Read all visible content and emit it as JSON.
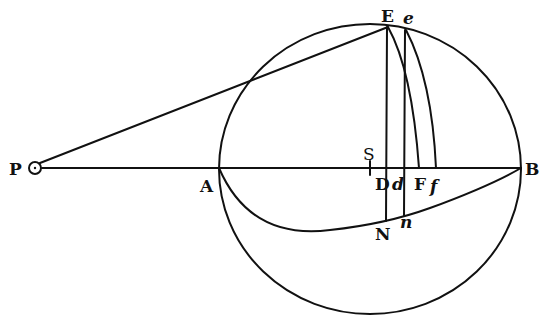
{
  "figure": {
    "type": "geometric-diagram",
    "colors": {
      "ink": "#111111",
      "background": "#ffffff"
    },
    "labels": {
      "P": "P",
      "A": "A",
      "S": "S",
      "D": "D",
      "d": "d",
      "F": "F",
      "f": "f",
      "B": "B",
      "E": "E",
      "e": "e",
      "N": "N",
      "n": "n"
    },
    "elements": [
      "circle through A, E, B",
      "line P to B through A, D, d, F, f",
      "line P to E",
      "line E to D to N",
      "line e to d to n",
      "line E to F",
      "curve e to f",
      "curve A through N, n to B",
      "small circle at P",
      "tick mark at S"
    ]
  }
}
